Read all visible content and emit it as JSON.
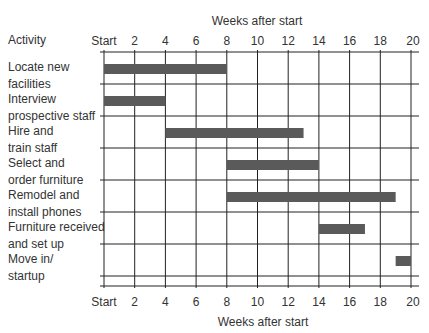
{
  "chart_data": {
    "type": "bar",
    "subtype": "gantt",
    "title": "",
    "xlabel_top": "Weeks after start",
    "xlabel_bottom": "Weeks after start",
    "ylabel": "Activity",
    "xlim": [
      0,
      20
    ],
    "tick_labels": [
      "Start",
      "2",
      "4",
      "6",
      "8",
      "10",
      "12",
      "14",
      "16",
      "18",
      "20"
    ],
    "tick_values": [
      0,
      2,
      4,
      6,
      8,
      10,
      12,
      14,
      16,
      18,
      20
    ],
    "grid": true,
    "activities": [
      {
        "label": "Locate new\nfacilities",
        "start": 0,
        "end": 8
      },
      {
        "label": "Interview\nprospective staff",
        "start": 0,
        "end": 4
      },
      {
        "label": "Hire and\ntrain staff",
        "start": 4,
        "end": 13
      },
      {
        "label": "Select and\norder furniture",
        "start": 8,
        "end": 14
      },
      {
        "label": "Remodel and\ninstall phones",
        "start": 8,
        "end": 19
      },
      {
        "label": "Furniture received\nand set up",
        "start": 14,
        "end": 17
      },
      {
        "label": "Move in/\nstartup",
        "start": 19,
        "end": 20
      }
    ],
    "bar_color": "#5a5a5a"
  },
  "header": {
    "activity": "Activity"
  }
}
